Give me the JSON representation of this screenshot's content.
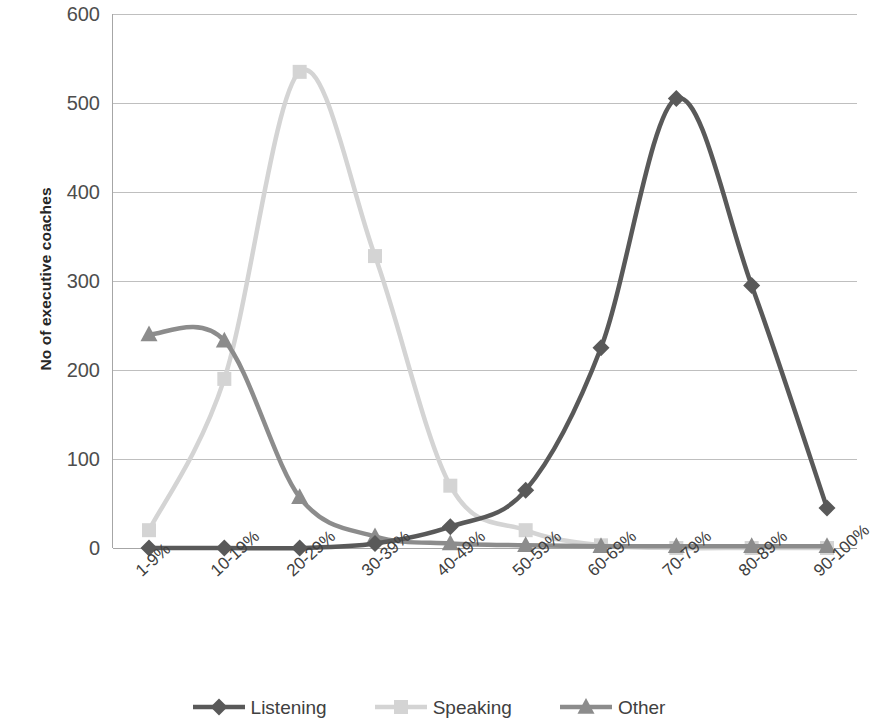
{
  "chart_data": {
    "type": "line",
    "title": "",
    "xlabel": "",
    "ylabel": "No of executive coaches",
    "categories": [
      "1-9%",
      "10-19%",
      "20-29%",
      "30-39%",
      "40-49%",
      "50-59%",
      "60-69%",
      "70-79%",
      "80-89%",
      "90-100%"
    ],
    "ylim": [
      0,
      600
    ],
    "yticks": [
      0,
      100,
      200,
      300,
      400,
      500,
      600
    ],
    "ytick_labels": [
      "0",
      "100",
      "200",
      "300",
      "400",
      "500",
      "600"
    ],
    "grid": true,
    "legend_position": "bottom",
    "smoothing": true,
    "series": [
      {
        "name": "Listening",
        "color": "#595959",
        "marker": "diamond",
        "values": [
          0,
          0,
          0,
          5,
          24,
          65,
          225,
          505,
          295,
          45
        ]
      },
      {
        "name": "Speaking",
        "color": "#d4d4d4",
        "marker": "square",
        "values": [
          20,
          190,
          535,
          328,
          70,
          20,
          3,
          0,
          0,
          0
        ]
      },
      {
        "name": "Other",
        "color": "#8c8c8c",
        "marker": "triangle",
        "values": [
          240,
          233,
          57,
          13,
          5,
          3,
          2,
          2,
          2,
          2
        ]
      }
    ]
  },
  "axis": {
    "y_title": "No of executive coaches"
  },
  "legend": {
    "items": [
      {
        "label": "Listening"
      },
      {
        "label": "Speaking"
      },
      {
        "label": "Other"
      }
    ]
  }
}
